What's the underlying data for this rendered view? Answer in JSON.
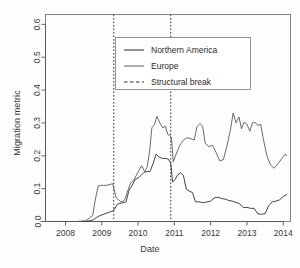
{
  "chart_data": {
    "type": "line",
    "title": "",
    "xlabel": "Date",
    "ylabel": "Migration metric",
    "xlim": [
      2007.45,
      2014.2
    ],
    "ylim": [
      0.0,
      0.63
    ],
    "grid": false,
    "legend_position": "top-center",
    "xticks": [
      2008,
      2009,
      2010,
      2011,
      2012,
      2013,
      2014
    ],
    "xtick_labels": [
      "2008",
      "2009",
      "2010",
      "2011",
      "2012",
      "2013",
      "2014"
    ],
    "yticks": [
      0.0,
      0.1,
      0.2,
      0.3,
      0.4,
      0.5,
      0.6
    ],
    "ytick_labels": [
      "0.0",
      "0.1",
      "0.2",
      "0.3",
      "0.4",
      "0.5",
      "0.6"
    ],
    "annotations": [
      {
        "name": "structural-break-1",
        "type": "vline",
        "x": 2009.33,
        "style": "dotted"
      },
      {
        "name": "structural-break-2",
        "type": "vline",
        "x": 2010.9,
        "style": "dotted"
      }
    ],
    "series": [
      {
        "name": "Northern America",
        "color": "#2e2e2e",
        "style": "solid",
        "x": [
          2007.5,
          2008.0,
          2008.3,
          2008.55,
          2008.7,
          2008.78,
          2008.85,
          2008.95,
          2009.05,
          2009.15,
          2009.25,
          2009.33,
          2009.42,
          2009.5,
          2009.58,
          2009.67,
          2009.75,
          2009.83,
          2009.92,
          2010.0,
          2010.08,
          2010.17,
          2010.25,
          2010.33,
          2010.42,
          2010.5,
          2010.58,
          2010.67,
          2010.75,
          2010.83,
          2010.9,
          2010.95,
          2011.02,
          2011.1,
          2011.17,
          2011.25,
          2011.33,
          2011.42,
          2011.5,
          2011.58,
          2011.67,
          2011.75,
          2011.83,
          2011.92,
          2012.0,
          2012.1,
          2012.2,
          2012.3,
          2012.4,
          2012.5,
          2012.6,
          2012.7,
          2012.8,
          2012.9,
          2013.0,
          2013.1,
          2013.2,
          2013.3,
          2013.4,
          2013.5,
          2013.6,
          2013.7,
          2013.8,
          2013.9,
          2014.0,
          2014.1
        ],
        "y": [
          0.0,
          0.0,
          0.0,
          0.0,
          0.003,
          0.006,
          0.012,
          0.018,
          0.022,
          0.026,
          0.03,
          0.034,
          0.052,
          0.055,
          0.057,
          0.06,
          0.095,
          0.108,
          0.128,
          0.132,
          0.14,
          0.15,
          0.152,
          0.152,
          0.178,
          0.205,
          0.196,
          0.192,
          0.192,
          0.19,
          0.178,
          0.12,
          0.128,
          0.143,
          0.148,
          0.14,
          0.098,
          0.092,
          0.088,
          0.06,
          0.06,
          0.058,
          0.058,
          0.06,
          0.062,
          0.072,
          0.074,
          0.07,
          0.068,
          0.064,
          0.062,
          0.058,
          0.054,
          0.042,
          0.043,
          0.04,
          0.04,
          0.023,
          0.022,
          0.024,
          0.048,
          0.06,
          0.062,
          0.066,
          0.076,
          0.082
        ]
      },
      {
        "name": "Europe",
        "color": "#5a5a5a",
        "style": "solid",
        "x": [
          2007.5,
          2008.0,
          2008.3,
          2008.55,
          2008.68,
          2008.75,
          2008.82,
          2008.9,
          2008.97,
          2009.05,
          2009.12,
          2009.2,
          2009.3,
          2009.4,
          2009.5,
          2009.58,
          2009.65,
          2009.72,
          2009.8,
          2009.88,
          2009.95,
          2010.02,
          2010.1,
          2010.18,
          2010.25,
          2010.32,
          2010.38,
          2010.45,
          2010.52,
          2010.6,
          2010.68,
          2010.75,
          2010.82,
          2010.88,
          2010.92,
          2010.97,
          2011.05,
          2011.15,
          2011.25,
          2011.35,
          2011.45,
          2011.55,
          2011.62,
          2011.7,
          2011.78,
          2011.85,
          2011.95,
          2012.05,
          2012.15,
          2012.25,
          2012.35,
          2012.45,
          2012.55,
          2012.62,
          2012.7,
          2012.78,
          2012.85,
          2012.92,
          2013.0,
          2013.08,
          2013.15,
          2013.22,
          2013.3,
          2013.38,
          2013.45,
          2013.55,
          2013.65,
          2013.75,
          2013.85,
          2013.95,
          2014.05,
          2014.1
        ],
        "y": [
          0.0,
          0.0,
          0.0,
          0.002,
          0.012,
          0.018,
          0.065,
          0.108,
          0.11,
          0.11,
          0.11,
          0.112,
          0.115,
          0.072,
          0.062,
          0.06,
          0.07,
          0.095,
          0.118,
          0.125,
          0.14,
          0.155,
          0.17,
          0.152,
          0.165,
          0.215,
          0.285,
          0.295,
          0.32,
          0.3,
          0.285,
          0.29,
          0.265,
          0.262,
          0.255,
          0.182,
          0.205,
          0.232,
          0.248,
          0.255,
          0.252,
          0.248,
          0.288,
          0.298,
          0.29,
          0.238,
          0.228,
          0.232,
          0.21,
          0.185,
          0.188,
          0.23,
          0.282,
          0.33,
          0.3,
          0.318,
          0.282,
          0.302,
          0.296,
          0.275,
          0.3,
          0.302,
          0.292,
          0.296,
          0.252,
          0.2,
          0.172,
          0.162,
          0.175,
          0.19,
          0.205,
          0.2
        ]
      },
      {
        "name": "Structural break",
        "color": "#333333",
        "style": "dashed",
        "x": [],
        "y": []
      }
    ],
    "legend": [
      {
        "label": "Northern America",
        "style": "solid",
        "color": "#2e2e2e"
      },
      {
        "label": "Europe",
        "style": "solid",
        "color": "#5a5a5a"
      },
      {
        "label": "Structural break",
        "style": "dashed",
        "color": "#333333"
      }
    ]
  }
}
